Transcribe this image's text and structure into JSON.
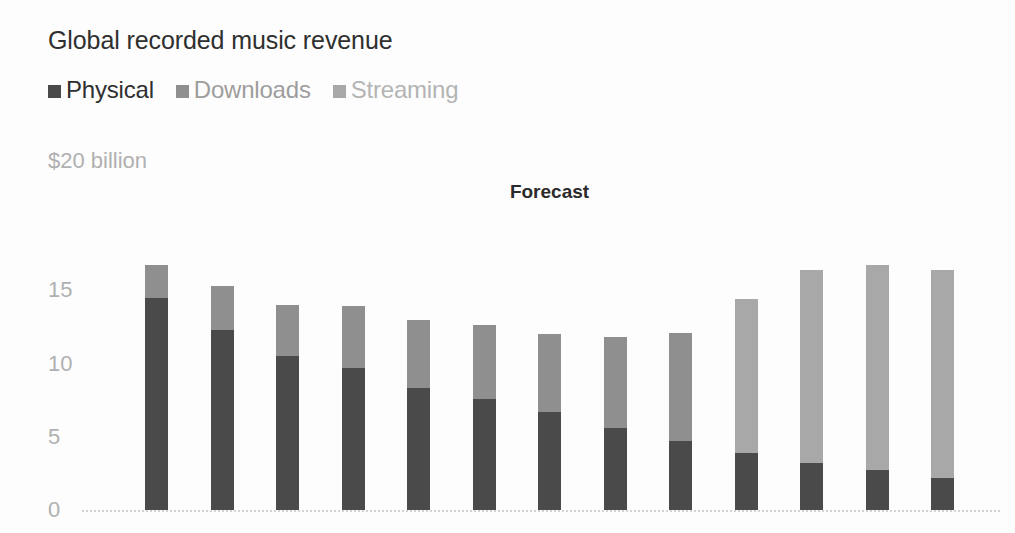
{
  "header": {
    "title": "Global recorded music revenue"
  },
  "legend": {
    "position": "top-left",
    "items": [
      {
        "label": "Physical",
        "color": "#4a4a4a",
        "text_color": "#2f2f2f"
      },
      {
        "label": "Downloads",
        "color": "#8f8f8f",
        "text_color": "#9d9d9d"
      },
      {
        "label": "Streaming",
        "color": "#a8a8a8",
        "text_color": "#b4b4b4"
      }
    ]
  },
  "annotations": [
    {
      "name": "forecast-label",
      "text": "Forecast",
      "x_value_index": 6.0
    }
  ],
  "axis": {
    "unit_label": "$20 billion",
    "tick_labels": [
      "0",
      "5",
      "10",
      "15"
    ],
    "tick_values": [
      0,
      5,
      10,
      15
    ],
    "top_tick_label": "$20 billion",
    "label_color": "#b0b0b0"
  },
  "colors": {
    "background": "#fdfdfd",
    "physical": "#4a4a4a",
    "downloads": "#8f8f8f",
    "streaming": "#a8a8a8",
    "gridline": "#d3d3d3",
    "title": "#2f2f2f",
    "axis_text": "#b0b0b0",
    "forecast_text": "#2b2b2b"
  },
  "chart_data": {
    "type": "bar",
    "subtype": "stacked-column",
    "title": "Global recorded music revenue",
    "subtitle": "",
    "xlabel": "",
    "ylabel": "$20 billion",
    "ylim": [
      0,
      20
    ],
    "yticks": [
      0,
      5,
      10,
      15,
      20
    ],
    "ytick_labels": [
      "0",
      "5",
      "10",
      "15",
      "$20 billion"
    ],
    "grid": false,
    "baseline_only": true,
    "legend_position": "top-left",
    "units": "billion USD",
    "categories": [
      "1",
      "2",
      "3",
      "4",
      "5",
      "6",
      "7",
      "8",
      "9",
      "10",
      "11",
      "12",
      "13"
    ],
    "n_bars": 13,
    "forecast_start_index": 9,
    "series": [
      {
        "name": "Physical",
        "color": "#4a4a4a",
        "values": [
          14.5,
          12.3,
          10.5,
          9.7,
          8.3,
          7.6,
          6.7,
          5.6,
          4.7,
          3.9,
          3.2,
          2.7,
          2.2
        ]
      },
      {
        "name": "Downloads",
        "color": "#8f8f8f",
        "values": [
          2.2,
          3.0,
          3.5,
          4.2,
          4.7,
          5.0,
          5.3,
          6.2,
          7.4,
          10.5,
          13.2,
          14.0,
          14.2
        ]
      },
      {
        "name": "Streaming",
        "color": "#a8a8a8",
        "values": [
          0.0,
          0.0,
          0.0,
          0.0,
          0.0,
          0.0,
          0.0,
          0.0,
          0.0,
          0.0,
          0.0,
          0.0,
          0.0
        ]
      }
    ],
    "totals": [
      16.7,
      15.3,
      14.0,
      13.9,
      13.0,
      12.6,
      12.0,
      11.8,
      12.1,
      14.4,
      16.4,
      16.7,
      16.4
    ],
    "annotations": [
      {
        "text": "Forecast",
        "at_bar_index": 6
      }
    ]
  },
  "layout": {
    "plot_left": 145,
    "plot_baseline_y": 510,
    "plot_top_y": 217,
    "bar_width": 23,
    "bar_step": 65.5,
    "gridline_left": 82,
    "gridline_right": 1000
  }
}
